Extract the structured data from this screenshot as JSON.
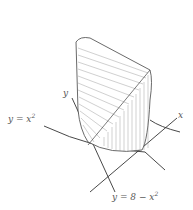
{
  "figure": {
    "labels": {
      "y_axis": "y",
      "x_axis": "x",
      "curve1": "y = x",
      "curve1_exp": "2",
      "curve2": "y = 8 − x",
      "curve2_exp": "2"
    },
    "colors": {
      "line": "#333333",
      "hatch": "#888888",
      "surface": "#ffffff"
    }
  }
}
